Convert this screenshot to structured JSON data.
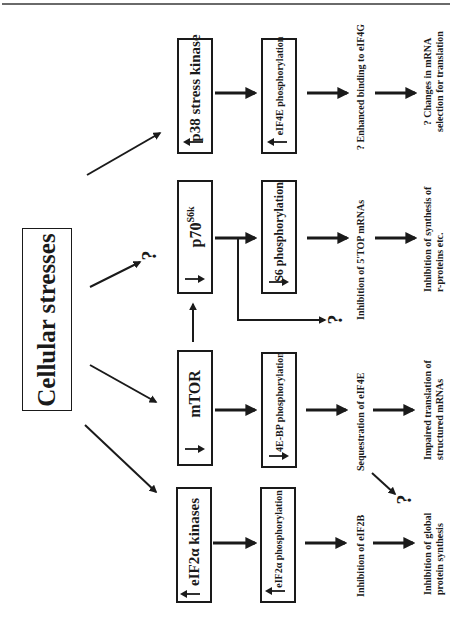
{
  "diagram": {
    "title": "Cellular stresses",
    "root": {
      "label": "Cellular stresses"
    },
    "columns": [
      {
        "kinase": {
          "label": "p38 stress kinase",
          "direction": "up"
        },
        "target": {
          "label": "eIF4E phosphorylation",
          "direction": "up"
        },
        "effect": {
          "label": "? Enhanced binding to eIF4G"
        },
        "outcome": {
          "line1": "? Changes in mRNA",
          "line2": "selection for translation"
        }
      },
      {
        "kinase": {
          "label": "p70",
          "superscript": "S6k",
          "direction": "down"
        },
        "target": {
          "label": "S6 phosphorylation",
          "direction": "down"
        },
        "effect": {
          "label": "Inhibition of 5'TOP mRNAs"
        },
        "outcome": {
          "line1": "Inhibition of synthesis of",
          "line2": "r-proteins etc."
        },
        "branch_unknown": "?",
        "upstream_unknown": "?"
      },
      {
        "kinase": {
          "label": "mTOR",
          "direction": "down"
        },
        "target": {
          "label": "4E-BP phosphorylation",
          "direction": "down"
        },
        "effect": {
          "label": "Sequestration of eIF4E"
        },
        "outcome": {
          "line1": "Impaired translation of",
          "line2": "structured mRNAs"
        },
        "cross_unknown": "?"
      },
      {
        "kinase": {
          "label": "eIF2α kinases",
          "direction": "up"
        },
        "target": {
          "label": "eIF2α phosphorylation",
          "direction": "up"
        },
        "effect": {
          "label": "Inhibition of eIF2B"
        },
        "outcome": {
          "line1": "Inhibition of global",
          "line2": "protein synthesis"
        }
      }
    ],
    "icons": {
      "increase": "arrow-up-icon",
      "decrease": "arrow-down-icon"
    },
    "colors": {
      "ink": "#1a1a1a",
      "background": "#ffffff",
      "rule": "#6a6a6a"
    }
  }
}
